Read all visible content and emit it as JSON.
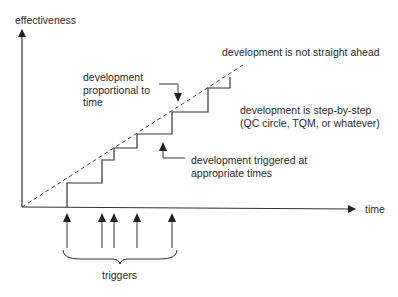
{
  "diagram": {
    "type": "concept-graph",
    "axes": {
      "y_label": "effectiveness",
      "x_label": "time"
    },
    "annotations": {
      "proportional": [
        "development",
        "proportional to",
        "time"
      ],
      "not_straight": "development is not straight ahead",
      "step_by_step": [
        "development is step-by-step",
        "(QC circle, TQM, or whatever)"
      ],
      "triggered": [
        "development triggered at",
        "appropriate times"
      ],
      "triggers": "triggers"
    },
    "series": [
      {
        "name": "development proportional to time",
        "style": "dashed",
        "points": [
          [
            22,
            207
          ],
          [
            243,
            65
          ]
        ]
      },
      {
        "name": "development is step-by-step",
        "style": "solid",
        "points": [
          [
            67,
            207
          ],
          [
            67,
            183
          ],
          [
            102,
            183
          ],
          [
            102,
            160
          ],
          [
            114,
            160
          ],
          [
            114,
            148
          ],
          [
            137,
            148
          ],
          [
            137,
            134
          ],
          [
            172,
            134
          ],
          [
            172,
            112
          ],
          [
            208,
            112
          ],
          [
            208,
            88
          ],
          [
            230,
            88
          ],
          [
            230,
            77
          ]
        ]
      }
    ],
    "trigger_positions_x": [
      67,
      102,
      114,
      137,
      172
    ],
    "colors": {
      "line": "#333333",
      "text": "#2a2a2a",
      "background": "#ffffff"
    }
  }
}
